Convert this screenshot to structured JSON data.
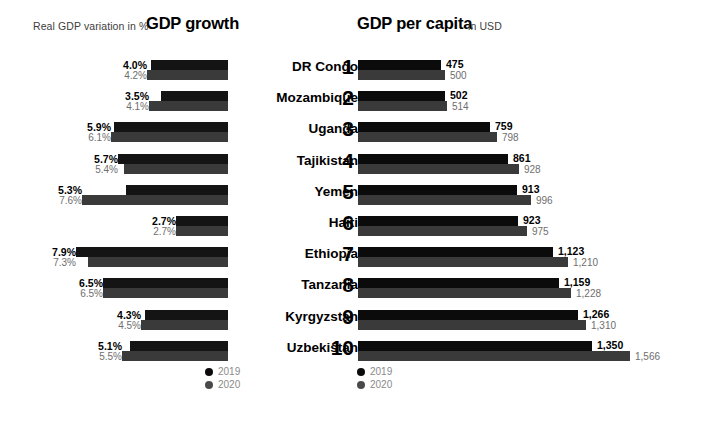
{
  "growth_panel": {
    "title": "GDP growth",
    "subtitle": "Real GDP variation in %",
    "legend": [
      {
        "label": "2019",
        "color": "#0b0b0b"
      },
      {
        "label": "2020",
        "color": "#4a4a4a"
      }
    ]
  },
  "capita_panel": {
    "title": "GDP per capita",
    "subtitle": "in USD",
    "legend": [
      {
        "label": "2019",
        "color": "#0b0b0b"
      },
      {
        "label": "2020",
        "color": "#4a4a4a"
      }
    ]
  },
  "rows": [
    {
      "rank": "1",
      "country": "DR Congo",
      "growth_2019": "4.0%",
      "growth_2020": "4.2%",
      "capita_2019": "475",
      "capita_2020": "500"
    },
    {
      "rank": "2",
      "country": "Mozambique",
      "growth_2019": "3.5%",
      "growth_2020": "4.1%",
      "capita_2019": "502",
      "capita_2020": "514"
    },
    {
      "rank": "3",
      "country": "Uganda",
      "growth_2019": "5.9%",
      "growth_2020": "6.1%",
      "capita_2019": "759",
      "capita_2020": "798"
    },
    {
      "rank": "4",
      "country": "Tajikistan",
      "growth_2019": "5.7%",
      "growth_2020": "5.4%",
      "capita_2019": "861",
      "capita_2020": "928"
    },
    {
      "rank": "5",
      "country": "Yemen",
      "growth_2019": "5.3%",
      "growth_2020": "7.6%",
      "capita_2019": "913",
      "capita_2020": "996"
    },
    {
      "rank": "6",
      "country": "Haiti",
      "growth_2019": "2.7%",
      "growth_2020": "2.7%",
      "capita_2019": "923",
      "capita_2020": "975"
    },
    {
      "rank": "7",
      "country": "Ethiopia",
      "growth_2019": "7.9%",
      "growth_2020": "7.3%",
      "capita_2019": "1,123",
      "capita_2020": "1,210"
    },
    {
      "rank": "8",
      "country": "Tanzania",
      "growth_2019": "6.5%",
      "growth_2020": "6.5%",
      "capita_2019": "1,159",
      "capita_2020": "1,228"
    },
    {
      "rank": "9",
      "country": "Kyrgyzstan",
      "growth_2019": "4.3%",
      "growth_2020": "4.5%",
      "capita_2019": "1,266",
      "capita_2020": "1,310"
    },
    {
      "rank": "10",
      "country": "Uzbekistan",
      "growth_2019": "5.1%",
      "growth_2020": "5.5%",
      "capita_2019": "1,350",
      "capita_2020": "1,566"
    }
  ],
  "chart_data": [
    {
      "type": "bar",
      "title": "GDP growth",
      "subtitle": "Real GDP variation in %",
      "orientation": "horizontal",
      "direction": "right-to-left",
      "xlabel": "Real GDP variation in %",
      "ylabel": "",
      "categories": [
        "DR Congo",
        "Mozambique",
        "Uganda",
        "Tajikistan",
        "Yemen",
        "Haiti",
        "Ethiopia",
        "Tanzania",
        "Kyrgyzstan",
        "Uzbekistan"
      ],
      "series": [
        {
          "name": "2019",
          "color": "#0b0b0b",
          "values": [
            4.0,
            3.5,
            5.9,
            5.7,
            5.3,
            2.7,
            7.9,
            6.5,
            4.3,
            5.1
          ]
        },
        {
          "name": "2020",
          "color": "#3a3a3a",
          "values": [
            4.2,
            4.1,
            6.1,
            5.4,
            7.6,
            2.7,
            7.3,
            6.5,
            4.5,
            5.5
          ]
        }
      ],
      "unit": "%",
      "xlim": [
        0,
        7.9
      ],
      "grid": false,
      "legend_position": "bottom"
    },
    {
      "type": "bar",
      "title": "GDP per capita",
      "subtitle": "in USD",
      "orientation": "horizontal",
      "direction": "left-to-right",
      "xlabel": "in USD",
      "ylabel": "",
      "categories": [
        "DR Congo",
        "Mozambique",
        "Uganda",
        "Tajikistan",
        "Yemen",
        "Haiti",
        "Ethiopia",
        "Tanzania",
        "Kyrgyzstan",
        "Uzbekistan"
      ],
      "series": [
        {
          "name": "2019",
          "color": "#0b0b0b",
          "values": [
            475,
            502,
            759,
            861,
            913,
            923,
            1123,
            1159,
            1266,
            1350
          ]
        },
        {
          "name": "2020",
          "color": "#3a3a3a",
          "values": [
            500,
            514,
            798,
            928,
            996,
            975,
            1210,
            1228,
            1310,
            1566
          ]
        }
      ],
      "unit": "USD",
      "xlim": [
        0,
        1566
      ],
      "grid": false,
      "legend_position": "bottom"
    }
  ]
}
